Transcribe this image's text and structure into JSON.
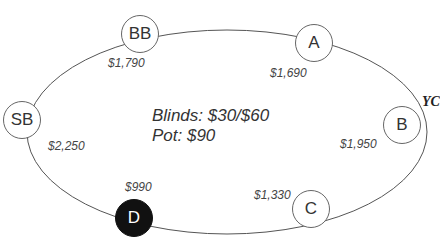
{
  "table": {
    "blinds": "Blinds: $30/$60",
    "pot": "Pot: $90"
  },
  "seats": {
    "bb": {
      "label": "BB",
      "stack": "$1,790"
    },
    "a": {
      "label": "A",
      "stack": "$1,690"
    },
    "b": {
      "label": "B",
      "stack": "$1,950"
    },
    "c": {
      "label": "C",
      "stack": "$1,330"
    },
    "d": {
      "label": "D",
      "stack": "$990",
      "dealer": true
    },
    "sb": {
      "label": "SB",
      "stack": "$2,250"
    }
  },
  "side_label": "YC",
  "colors": {
    "dealer_fill": "#111111",
    "seat_border": "#666666",
    "table_line": "#555555"
  }
}
